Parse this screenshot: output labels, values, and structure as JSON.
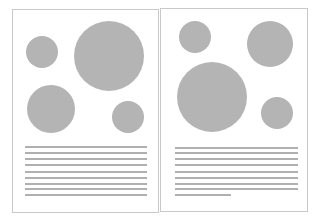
{
  "colors": {
    "page_border": "#c9c9c9",
    "shape_fill": "#b4b4b4",
    "line_fill": "#b0b0b0",
    "background": "#ffffff"
  },
  "pages": [
    {
      "name": "left-page",
      "box": {
        "x": 12,
        "y": 9,
        "w": 147,
        "h": 204
      },
      "circles": [
        {
          "cx": 42,
          "cy": 52,
          "r": 16
        },
        {
          "cx": 109,
          "cy": 56,
          "r": 35
        },
        {
          "cx": 51,
          "cy": 109,
          "r": 24
        },
        {
          "cx": 128,
          "cy": 117,
          "r": 16
        }
      ],
      "lines": [
        {
          "x": 25,
          "y": 146,
          "w": 122
        },
        {
          "x": 25,
          "y": 152,
          "w": 122
        },
        {
          "x": 25,
          "y": 158,
          "w": 122
        },
        {
          "x": 25,
          "y": 164,
          "w": 122
        },
        {
          "x": 25,
          "y": 171,
          "w": 122
        },
        {
          "x": 25,
          "y": 177,
          "w": 122
        },
        {
          "x": 25,
          "y": 183,
          "w": 122
        },
        {
          "x": 25,
          "y": 188,
          "w": 122
        },
        {
          "x": 25,
          "y": 194,
          "w": 122
        }
      ]
    },
    {
      "name": "right-page",
      "box": {
        "x": 160,
        "y": 8,
        "w": 148,
        "h": 204
      },
      "circles": [
        {
          "cx": 195,
          "cy": 37,
          "r": 16
        },
        {
          "cx": 270,
          "cy": 44,
          "r": 23
        },
        {
          "cx": 212,
          "cy": 97,
          "r": 35
        },
        {
          "cx": 277,
          "cy": 113,
          "r": 16
        }
      ],
      "lines": [
        {
          "x": 175,
          "y": 147,
          "w": 123
        },
        {
          "x": 175,
          "y": 152,
          "w": 123
        },
        {
          "x": 175,
          "y": 158,
          "w": 123
        },
        {
          "x": 175,
          "y": 164,
          "w": 123
        },
        {
          "x": 175,
          "y": 171,
          "w": 123
        },
        {
          "x": 175,
          "y": 177,
          "w": 123
        },
        {
          "x": 175,
          "y": 183,
          "w": 123
        },
        {
          "x": 175,
          "y": 188,
          "w": 123
        },
        {
          "x": 175,
          "y": 194,
          "w": 56
        }
      ]
    }
  ]
}
